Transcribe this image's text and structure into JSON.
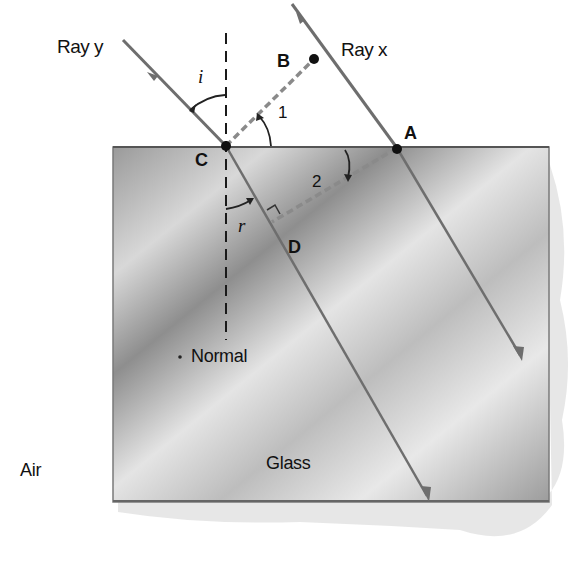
{
  "diagram": {
    "type": "refraction-geometry",
    "labels": {
      "ray_y": "Ray y",
      "ray_x": "Ray x",
      "point_a": "A",
      "point_b": "B",
      "point_c": "C",
      "point_d": "D",
      "angle_i": "i",
      "angle_r": "r",
      "angle_1": "1",
      "angle_2": "2",
      "normal": "Normal",
      "medium_air": "Air",
      "medium_glass": "Glass"
    },
    "colors": {
      "ray": "#6e6e6e",
      "dashed_wavefront": "#8a8a8a",
      "normal_line": "#1a1a1a",
      "glass_dark": "#8c8c8c",
      "glass_light": "#e6e6e6",
      "text": "#111111"
    }
  }
}
